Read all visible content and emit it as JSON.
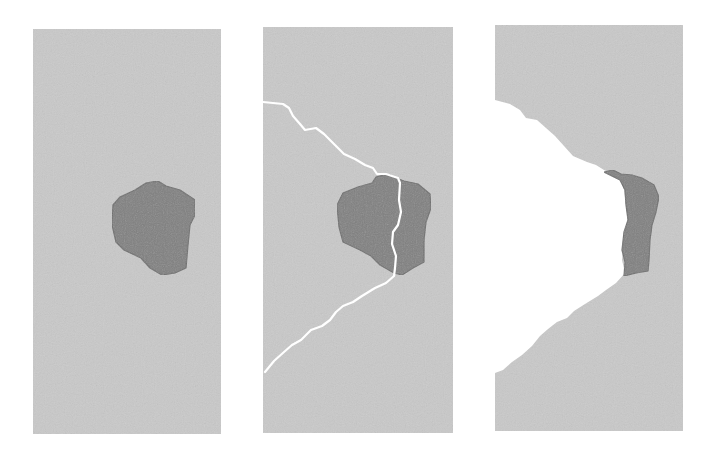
{
  "figure": {
    "colors": {
      "background": "#ffffff",
      "matrix": "#c9c9c9",
      "particle": "#808080",
      "particle_edge": "#6e6e6e",
      "crack": "#ffffff"
    },
    "panels": [
      {
        "id": "panel-1",
        "state": "intact",
        "rect": {
          "x": 33,
          "y": 29,
          "w": 188,
          "h": 405
        },
        "particle_points": "146,183 158,181 166,186 180,190 195,200 195,215 190,225 188,245 186,268 175,273 162,275 150,268 141,258 124,250 116,242 112,225 113,205 120,197 135,190"
      },
      {
        "id": "panel-2",
        "state": "cracked",
        "rect": {
          "x": 263,
          "y": 27,
          "w": 190,
          "h": 406
        },
        "particle_points": "376,177 388,174 396,178 404,181 418,184 430,194 431,208 426,222 424,240 424,262 413,268 402,275 394,273 380,265 371,256 360,250 343,242 339,227 337,205 343,193 358,187 372,183",
        "crack_points": "263,102 283,104 289,108 293,116 300,124 305,130 316,128 324,134 336,146 344,154 355,159 365,165 373,168 377,174 386,174 398,178 400,183 399,200 401,212 398,225 393,232 392,244 396,256 395,268 394,276 386,283 375,288 362,296 353,302 343,306 336,312 330,320 322,326 311,330 301,340 292,345 284,352 274,361 265,372"
      },
      {
        "id": "panel-3",
        "state": "separated",
        "rect": {
          "x": 495,
          "y": 25,
          "w": 188,
          "h": 406
        },
        "void_points": "495,100 510,104 520,110 526,118 537,120 546,128 555,136 564,146 573,156 587,162 596,165 604,170 612,174 621,178 624,190 626,205 628,222 624,240 622,260 625,273 616,283 606,290 598,296 585,304 574,311 567,318 557,322 548,329 540,336 532,346 522,355 512,362 503,370 495,373",
        "particle_points": "604,172 613,170 621,174 632,175 642,178 654,185 659,197 656,212 652,225 650,240 649,260 648,271 636,273 624,276 625,262 622,250 624,232 628,220 626,205 625,190 620,180"
      }
    ]
  }
}
